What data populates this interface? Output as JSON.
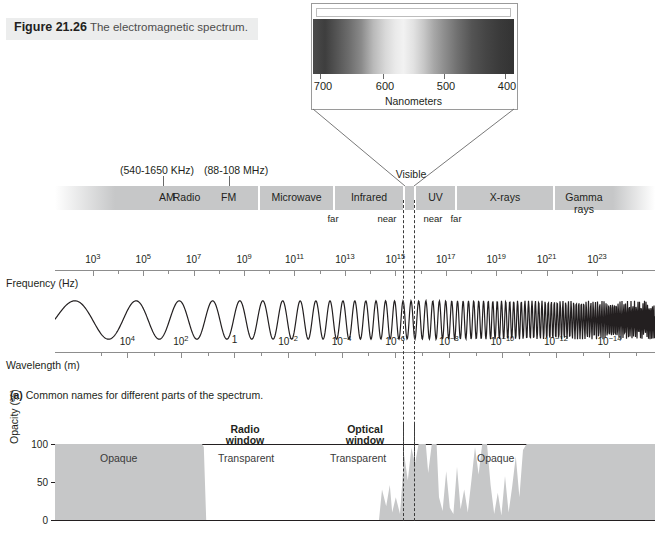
{
  "figure": {
    "number": "Figure 21.26",
    "title": "The electromagnetic spectrum.",
    "part_a_label": "(a)",
    "part_a_caption": "Common names for different parts of the spectrum."
  },
  "visible_callout": {
    "axis_title": "Nanometers",
    "ticks": [
      "700",
      "600",
      "500",
      "400"
    ],
    "visible_label": "Visible"
  },
  "band_annotations": {
    "am_range": "(540-1650 KHz)",
    "fm_range": "(88-108 MHz)"
  },
  "spectrum_bands": [
    {
      "name": "Radio"
    },
    {
      "name": "AM"
    },
    {
      "name": "FM"
    },
    {
      "name": "Microwave"
    },
    {
      "name": "Infrared"
    },
    {
      "name": "UV"
    },
    {
      "name": "X-rays"
    },
    {
      "name": "Gamma rays"
    }
  ],
  "sub_bands": [
    {
      "label": "far"
    },
    {
      "label": "near"
    },
    {
      "label": "near"
    },
    {
      "label": "far"
    }
  ],
  "chart_data": {
    "type": "line",
    "title": "The electromagnetic spectrum",
    "frequency_axis": {
      "label": "Frequency (Hz)",
      "unit": "Hz",
      "tick_labels": [
        "10^3",
        "10^5",
        "10^7",
        "10^9",
        "10^11",
        "10^13",
        "10^15",
        "10^17",
        "10^19",
        "10^21",
        "10^23"
      ],
      "exponents": [
        3,
        5,
        7,
        9,
        11,
        13,
        15,
        17,
        19,
        21,
        23
      ],
      "direction": "increasing-rightward"
    },
    "wavelength_axis": {
      "label": "Wavelength (m)",
      "unit": "m",
      "tick_labels": [
        "10^4",
        "10^2",
        "1",
        "10^-2",
        "10^-4",
        "10^-6",
        "10^-8",
        "10^-10",
        "10^-12",
        "10^-14"
      ],
      "exponents": [
        4,
        2,
        0,
        -2,
        -4,
        -6,
        -8,
        -10,
        -12,
        -14
      ],
      "direction": "decreasing-rightward"
    },
    "opacity_chart": {
      "ylabel": "Opacity (%)",
      "yticks": [
        "0",
        "50",
        "100"
      ],
      "ylim": [
        0,
        100
      ],
      "regions": [
        {
          "label": "Opaque",
          "opacity": 100
        },
        {
          "label": "Transparent",
          "opacity": 0,
          "window": "Radio window"
        },
        {
          "label": "Transparent",
          "opacity": 0,
          "window": "Optical window"
        },
        {
          "label": "Opaque",
          "opacity": 100
        }
      ],
      "windows": [
        {
          "line1": "Radio",
          "line2": "window"
        },
        {
          "line1": "Optical",
          "line2": "window"
        }
      ]
    }
  }
}
